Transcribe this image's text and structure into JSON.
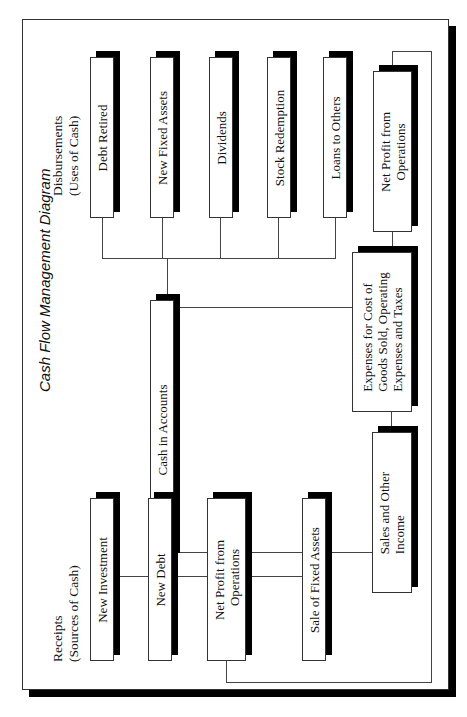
{
  "title": "Cash Flow Management Diagram",
  "groups": {
    "disbursements": "Disbursements\n(Uses of Cash)",
    "disbursements_line1": "Disbursements",
    "disbursements_line2": "(Uses of Cash)",
    "receipts_line1": "Receipts",
    "receipts_line2": "(Sources of Cash)"
  },
  "nodes": {
    "cash": "Cash in Accounts",
    "debt_retired": "Debt Retired",
    "new_fixed_assets": "New Fixed Assets",
    "dividends": "Dividends",
    "stock_redemption": "Stock Redemption",
    "loans_to_others": "Loans to Others",
    "net_profit_top_l1": "Net Profit from",
    "net_profit_top_l2": "Operations",
    "expenses_l1": "Expenses for Cost of",
    "expenses_l2": "Goods Sold, Operating",
    "expenses_l3": "Expenses and Taxes",
    "sales_l1": "Sales and Other",
    "sales_l2": "Income",
    "new_investment": "New Investment",
    "new_debt": "New Debt",
    "net_profit_bottom_l1": "Net Profit from",
    "net_profit_bottom_l2": "Operations",
    "sale_fixed_assets": "Sale of Fixed Assets"
  },
  "colors": {
    "line": "#444444",
    "shadow": "#000000",
    "box_fill": "#ffffff"
  }
}
